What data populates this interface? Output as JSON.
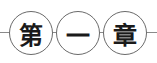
{
  "heading": {
    "characters": [
      "第",
      "一",
      "章"
    ],
    "text": "第一章",
    "colors": {
      "text": "#1a1a1a",
      "circle_border": "#6a6a6a",
      "line": "#8a8a8a"
    }
  }
}
